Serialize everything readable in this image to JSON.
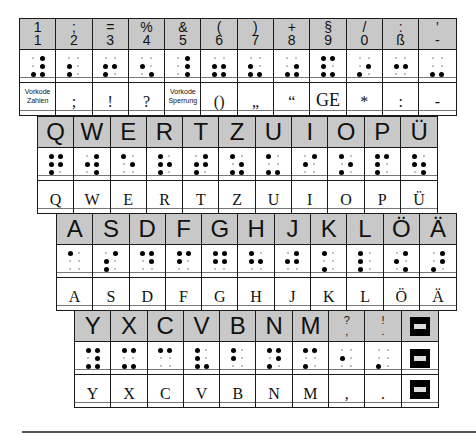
{
  "rows": [
    {
      "name": "number-row",
      "left": 19,
      "top": 18,
      "keys": [
        {
          "top": "1",
          "bottom": "1",
          "dots": [
            3,
            4,
            5,
            6
          ],
          "label": "Vorkode Zahlen",
          "tiny": true
        },
        {
          "top": ";",
          "bottom": "2",
          "dots": [
            2,
            3
          ],
          "label": ";"
        },
        {
          "top": "=",
          "bottom": "3",
          "dots": [
            2,
            3,
            5
          ],
          "label": "!"
        },
        {
          "top": "%",
          "bottom": "4",
          "dots": [
            2,
            6
          ],
          "label": "?"
        },
        {
          "top": "&",
          "bottom": "5",
          "dots": [
            4,
            5,
            6
          ],
          "label": "Vorkode Sperrung",
          "tiny": true
        },
        {
          "top": "(",
          "bottom": "6",
          "dots": [
            2,
            3,
            5,
            6
          ],
          "label": "()"
        },
        {
          "top": ")",
          "bottom": "7",
          "dots": [
            2,
            3,
            6
          ],
          "label": "„"
        },
        {
          "top": "+",
          "bottom": "8",
          "dots": [
            3,
            5,
            6
          ],
          "label": "“"
        },
        {
          "top": "§",
          "bottom": "9",
          "dots": [
            1,
            2,
            3,
            4,
            6
          ],
          "label": "GE",
          "ge": true
        },
        {
          "top": "/",
          "bottom": "0",
          "dots": [
            3,
            5
          ],
          "label": "*"
        },
        {
          "top": ":",
          "bottom": "ß",
          "dots": [
            2,
            5
          ],
          "label": ":"
        },
        {
          "top": "’",
          "bottom": "-",
          "dots": [
            3,
            6
          ],
          "label": "-"
        }
      ]
    },
    {
      "name": "qwertz-row",
      "left": 37,
      "top": 116,
      "keys": [
        {
          "top": "Q",
          "dots": [
            1,
            2,
            3,
            4,
            5
          ],
          "label": "Q"
        },
        {
          "top": "W",
          "dots": [
            2,
            4,
            5,
            6
          ],
          "label": "W"
        },
        {
          "top": "E",
          "dots": [
            1,
            5
          ],
          "label": "E"
        },
        {
          "top": "R",
          "dots": [
            1,
            2,
            3,
            5
          ],
          "label": "R"
        },
        {
          "top": "T",
          "dots": [
            2,
            3,
            4,
            5
          ],
          "label": "T"
        },
        {
          "top": "Z",
          "dots": [
            1,
            3,
            5,
            6
          ],
          "label": "Z"
        },
        {
          "top": "U",
          "dots": [
            1,
            3,
            6
          ],
          "label": "U"
        },
        {
          "top": "I",
          "dots": [
            2,
            4
          ],
          "label": "I"
        },
        {
          "top": "O",
          "dots": [
            1,
            3,
            5
          ],
          "label": "O"
        },
        {
          "top": "P",
          "dots": [
            1,
            2,
            3,
            4
          ],
          "label": "P"
        },
        {
          "top": "Ü",
          "dots": [
            1,
            2,
            5,
            6
          ],
          "label": "Ü"
        }
      ]
    },
    {
      "name": "asdf-row",
      "left": 56,
      "top": 213,
      "keys": [
        {
          "top": "A",
          "dots": [
            1
          ],
          "label": "A"
        },
        {
          "top": "S",
          "dots": [
            2,
            3,
            4
          ],
          "label": "S"
        },
        {
          "top": "D",
          "dots": [
            1,
            4,
            5
          ],
          "label": "D"
        },
        {
          "top": "F",
          "dots": [
            1,
            2,
            4
          ],
          "label": "F"
        },
        {
          "top": "G",
          "dots": [
            1,
            2,
            4,
            5
          ],
          "label": "G"
        },
        {
          "top": "H",
          "dots": [
            1,
            2,
            5
          ],
          "label": "H"
        },
        {
          "top": "J",
          "dots": [
            2,
            4,
            5
          ],
          "label": "J"
        },
        {
          "top": "K",
          "dots": [
            1,
            3
          ],
          "label": "K"
        },
        {
          "top": "L",
          "dots": [
            1,
            2,
            3
          ],
          "label": "L"
        },
        {
          "top": "Ö",
          "dots": [
            2,
            4,
            6
          ],
          "label": "Ö"
        },
        {
          "top": "Ä",
          "dots": [
            3,
            4,
            5
          ],
          "label": "Ä"
        }
      ]
    },
    {
      "name": "yxcv-row",
      "left": 74,
      "top": 310,
      "keys": [
        {
          "top": "Y",
          "dots": [
            1,
            3,
            4,
            5,
            6
          ],
          "label": "Y"
        },
        {
          "top": "X",
          "dots": [
            1,
            3,
            4,
            6
          ],
          "label": "X"
        },
        {
          "top": "C",
          "dots": [
            1,
            4
          ],
          "label": "C"
        },
        {
          "top": "V",
          "dots": [
            1,
            2,
            3,
            6
          ],
          "label": "V"
        },
        {
          "top": "B",
          "dots": [
            1,
            2
          ],
          "label": "B"
        },
        {
          "top": "N",
          "dots": [
            1,
            3,
            4,
            5
          ],
          "label": "N"
        },
        {
          "top": "M",
          "dots": [
            1,
            3,
            4
          ],
          "label": "M"
        },
        {
          "top": "?",
          "bottom": ",",
          "dots": [
            2
          ],
          "label": ",",
          "smallhdr": true
        },
        {
          "top": "!",
          "bottom": ".",
          "dots": [
            3
          ],
          "label": ".",
          "smallhdr": true
        },
        {
          "top": "",
          "dots": null,
          "label": "",
          "block": true
        }
      ]
    }
  ]
}
